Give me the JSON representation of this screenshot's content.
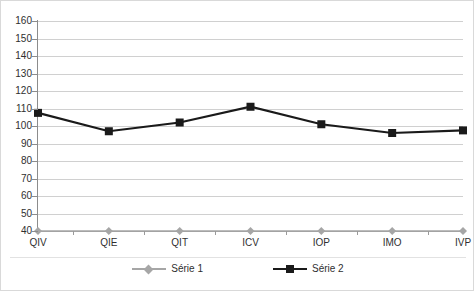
{
  "chart_data": {
    "type": "line",
    "title": "",
    "xlabel": "",
    "ylabel": "",
    "categories": [
      "QIV",
      "QIE",
      "QIT",
      "ICV",
      "IOP",
      "IMO",
      "IVP"
    ],
    "ylim": [
      40,
      160
    ],
    "ytick_step": 10,
    "yticks": [
      160,
      150,
      140,
      130,
      120,
      110,
      100,
      90,
      80,
      70,
      60,
      50,
      40
    ],
    "grid": true,
    "legend_position": "bottom-center",
    "series": [
      {
        "name": "Série 1",
        "values": [
          40,
          40,
          40,
          40,
          40,
          40,
          40
        ],
        "color": "#a6a6a6",
        "marker": "diamond"
      },
      {
        "name": "Série 2",
        "values": [
          107.5,
          97,
          102,
          111,
          101,
          96,
          97.5
        ],
        "color": "#1a1a1a",
        "marker": "square"
      }
    ]
  },
  "legend": {
    "items": [
      {
        "label": "Série 1"
      },
      {
        "label": "Série 2"
      }
    ]
  },
  "colors": {
    "series1": "#a6a6a6",
    "series2": "#1a1a1a",
    "gridline": "#d0d0d0",
    "axis": "#8c8c8c",
    "text": "#2f2f2f",
    "border": "#d9d9d9",
    "background": "#ffffff"
  }
}
